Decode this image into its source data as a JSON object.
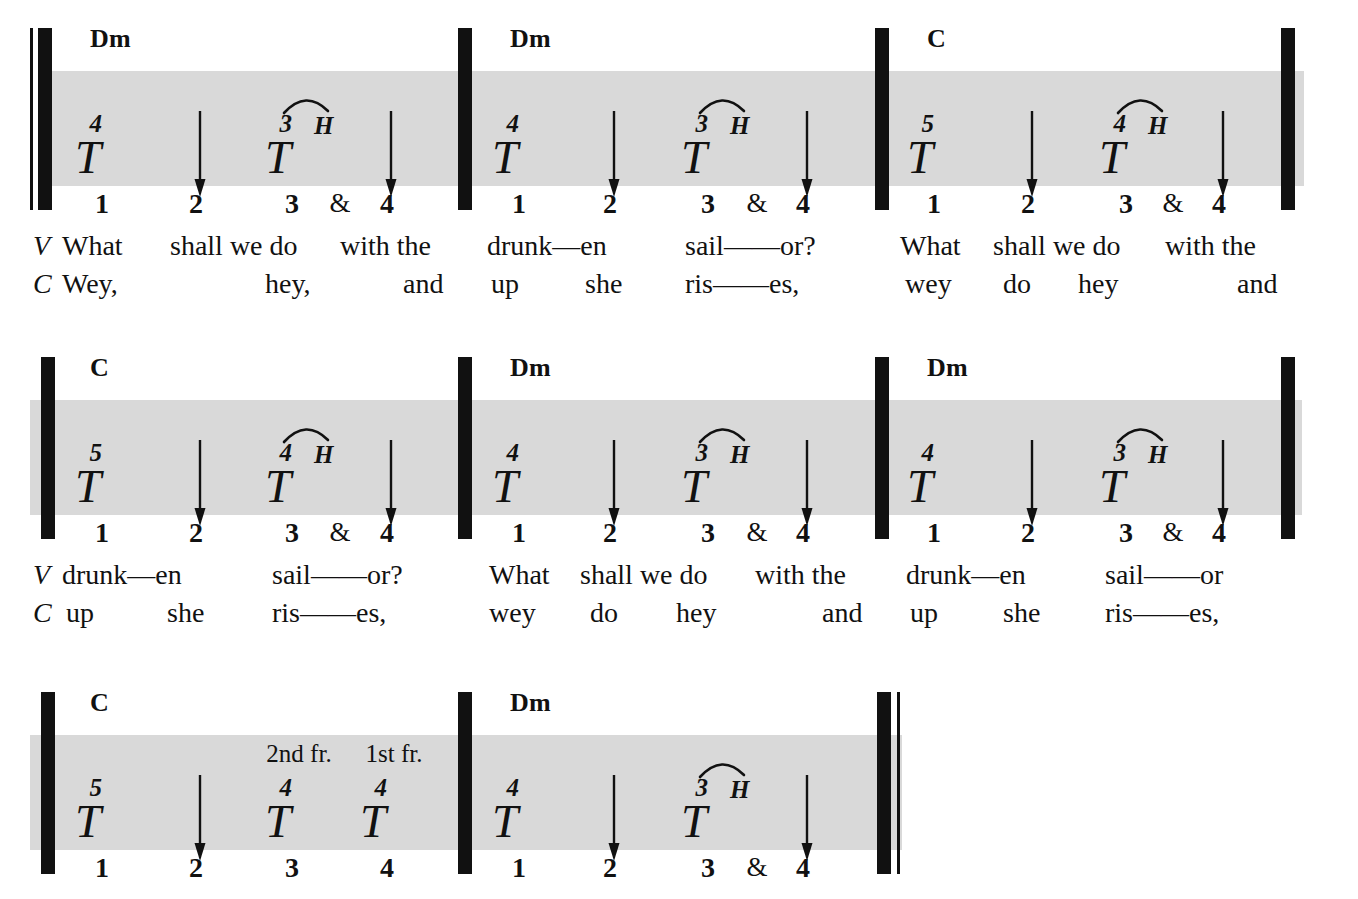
{
  "document": {
    "type": "guitar-tablature-rhythm-chart",
    "song_section": "What Shall We Do With The Drunken Sailor",
    "lyric_line_tags": {
      "verse": "V",
      "chorus": "C"
    },
    "colors": {
      "ink": "#111111",
      "band": "#d9d9d9",
      "page": "#ffffff"
    }
  },
  "systems": [
    {
      "id": "system-1",
      "measures": [
        {
          "id": "m1",
          "chord": "Dm",
          "slots": [
            {
              "beat": "1",
              "fret": "4",
              "symbol": "T",
              "hammer": null,
              "slur": false,
              "arrow": false,
              "fr_label": null
            },
            {
              "beat": "2",
              "fret": null,
              "symbol": null,
              "hammer": null,
              "slur": false,
              "arrow": true,
              "fr_label": null
            },
            {
              "beat": "3",
              "fret": "3",
              "symbol": "T",
              "hammer": "H",
              "slur": true,
              "arrow": false,
              "fr_label": null
            },
            {
              "beat": "&",
              "fret": null,
              "symbol": null,
              "hammer": null,
              "slur": false,
              "arrow": false,
              "fr_label": null
            },
            {
              "beat": "4",
              "fret": null,
              "symbol": null,
              "hammer": null,
              "slur": false,
              "arrow": true,
              "fr_label": null
            }
          ]
        },
        {
          "id": "m2",
          "chord": "Dm",
          "slots": [
            {
              "beat": "1",
              "fret": "4",
              "symbol": "T",
              "hammer": null,
              "slur": false,
              "arrow": false,
              "fr_label": null
            },
            {
              "beat": "2",
              "fret": null,
              "symbol": null,
              "hammer": null,
              "slur": false,
              "arrow": true,
              "fr_label": null
            },
            {
              "beat": "3",
              "fret": "3",
              "symbol": "T",
              "hammer": "H",
              "slur": true,
              "arrow": false,
              "fr_label": null
            },
            {
              "beat": "&",
              "fret": null,
              "symbol": null,
              "hammer": null,
              "slur": false,
              "arrow": false,
              "fr_label": null
            },
            {
              "beat": "4",
              "fret": null,
              "symbol": null,
              "hammer": null,
              "slur": false,
              "arrow": true,
              "fr_label": null
            }
          ]
        },
        {
          "id": "m3",
          "chord": "C",
          "slots": [
            {
              "beat": "1",
              "fret": "5",
              "symbol": "T",
              "hammer": null,
              "slur": false,
              "arrow": false,
              "fr_label": null
            },
            {
              "beat": "2",
              "fret": null,
              "symbol": null,
              "hammer": null,
              "slur": false,
              "arrow": true,
              "fr_label": null
            },
            {
              "beat": "3",
              "fret": "4",
              "symbol": "T",
              "hammer": "H",
              "slur": true,
              "arrow": false,
              "fr_label": null
            },
            {
              "beat": "&",
              "fret": null,
              "symbol": null,
              "hammer": null,
              "slur": false,
              "arrow": false,
              "fr_label": null
            },
            {
              "beat": "4",
              "fret": null,
              "symbol": null,
              "hammer": null,
              "slur": false,
              "arrow": true,
              "fr_label": null
            }
          ]
        }
      ],
      "lyrics": {
        "verse": [
          "What",
          "shall we do",
          "with the",
          "drunk—en",
          "sail——or?",
          "What",
          "shall we do",
          "with the"
        ],
        "chorus": [
          "Wey,",
          "hey,",
          "and",
          "up",
          "she",
          "ris——es,",
          "wey",
          "do",
          "hey",
          "and"
        ]
      }
    },
    {
      "id": "system-2",
      "measures": [
        {
          "id": "m4",
          "chord": "C",
          "slots": [
            {
              "beat": "1",
              "fret": "5",
              "symbol": "T",
              "hammer": null,
              "slur": false,
              "arrow": false,
              "fr_label": null
            },
            {
              "beat": "2",
              "fret": null,
              "symbol": null,
              "hammer": null,
              "slur": false,
              "arrow": true,
              "fr_label": null
            },
            {
              "beat": "3",
              "fret": "4",
              "symbol": "T",
              "hammer": "H",
              "slur": true,
              "arrow": false,
              "fr_label": null
            },
            {
              "beat": "&",
              "fret": null,
              "symbol": null,
              "hammer": null,
              "slur": false,
              "arrow": false,
              "fr_label": null
            },
            {
              "beat": "4",
              "fret": null,
              "symbol": null,
              "hammer": null,
              "slur": false,
              "arrow": true,
              "fr_label": null
            }
          ]
        },
        {
          "id": "m5",
          "chord": "Dm",
          "slots": [
            {
              "beat": "1",
              "fret": "4",
              "symbol": "T",
              "hammer": null,
              "slur": false,
              "arrow": false,
              "fr_label": null
            },
            {
              "beat": "2",
              "fret": null,
              "symbol": null,
              "hammer": null,
              "slur": false,
              "arrow": true,
              "fr_label": null
            },
            {
              "beat": "3",
              "fret": "3",
              "symbol": "T",
              "hammer": "H",
              "slur": true,
              "arrow": false,
              "fr_label": null
            },
            {
              "beat": "&",
              "fret": null,
              "symbol": null,
              "hammer": null,
              "slur": false,
              "arrow": false,
              "fr_label": null
            },
            {
              "beat": "4",
              "fret": null,
              "symbol": null,
              "hammer": null,
              "slur": false,
              "arrow": true,
              "fr_label": null
            }
          ]
        },
        {
          "id": "m6",
          "chord": "Dm",
          "slots": [
            {
              "beat": "1",
              "fret": "4",
              "symbol": "T",
              "hammer": null,
              "slur": false,
              "arrow": false,
              "fr_label": null
            },
            {
              "beat": "2",
              "fret": null,
              "symbol": null,
              "hammer": null,
              "slur": false,
              "arrow": true,
              "fr_label": null
            },
            {
              "beat": "3",
              "fret": "3",
              "symbol": "T",
              "hammer": "H",
              "slur": true,
              "arrow": false,
              "fr_label": null
            },
            {
              "beat": "&",
              "fret": null,
              "symbol": null,
              "hammer": null,
              "slur": false,
              "arrow": false,
              "fr_label": null
            },
            {
              "beat": "4",
              "fret": null,
              "symbol": null,
              "hammer": null,
              "slur": false,
              "arrow": true,
              "fr_label": null
            }
          ]
        }
      ],
      "lyrics": {
        "verse": [
          "drunk—en",
          "sail——or?",
          "What",
          "shall we do",
          "with the",
          "drunk—en",
          "sail——or"
        ],
        "chorus": [
          "up",
          "she",
          "ris——es,",
          "wey",
          "do",
          "hey",
          "and",
          "up",
          "she",
          "ris——es,"
        ]
      }
    },
    {
      "id": "system-3",
      "measures": [
        {
          "id": "m7",
          "chord": "C",
          "slots": [
            {
              "beat": "1",
              "fret": "5",
              "symbol": "T",
              "hammer": null,
              "slur": false,
              "arrow": false,
              "fr_label": null
            },
            {
              "beat": "2",
              "fret": null,
              "symbol": null,
              "hammer": null,
              "slur": false,
              "arrow": true,
              "fr_label": null
            },
            {
              "beat": "3",
              "fret": "4",
              "symbol": "T",
              "hammer": null,
              "slur": false,
              "arrow": false,
              "fr_label": "2nd fr."
            },
            {
              "beat": "4",
              "fret": "4",
              "symbol": "T",
              "hammer": null,
              "slur": false,
              "arrow": false,
              "fr_label": "1st fr."
            }
          ]
        },
        {
          "id": "m8",
          "chord": "Dm",
          "slots": [
            {
              "beat": "1",
              "fret": "4",
              "symbol": "T",
              "hammer": null,
              "slur": false,
              "arrow": false,
              "fr_label": null
            },
            {
              "beat": "2",
              "fret": null,
              "symbol": null,
              "hammer": null,
              "slur": false,
              "arrow": true,
              "fr_label": null
            },
            {
              "beat": "3",
              "fret": "3",
              "symbol": "T",
              "hammer": "H",
              "slur": true,
              "arrow": false,
              "fr_label": null
            },
            {
              "beat": "&",
              "fret": null,
              "symbol": null,
              "hammer": null,
              "slur": false,
              "arrow": false,
              "fr_label": null
            },
            {
              "beat": "4",
              "fret": null,
              "symbol": null,
              "hammer": null,
              "slur": false,
              "arrow": true,
              "fr_label": null
            }
          ]
        }
      ],
      "lyrics": {
        "verse": [],
        "chorus": []
      }
    }
  ],
  "layout": {
    "system_tops": [
      14,
      343,
      678
    ],
    "lyric_tops": [
      232,
      561
    ],
    "systems": [
      {
        "band": {
          "left": 52,
          "width": 1252
        },
        "barlines": [
          {
            "kind": "thin",
            "x": 30
          },
          {
            "kind": "thick",
            "x": 38
          },
          {
            "kind": "thick",
            "x": 458
          },
          {
            "kind": "thick",
            "x": 875
          },
          {
            "kind": "thick",
            "x": 1281
          }
        ],
        "measures": [
          {
            "left": 52,
            "chord_x": 38,
            "slot_x": [
              102,
              196,
              292,
              340,
              387
            ]
          },
          {
            "left": 472,
            "chord_x": 38,
            "slot_x": [
              519,
              610,
              708,
              757,
              803
            ]
          },
          {
            "left": 889,
            "chord_x": 38,
            "slot_x": [
              934,
              1028,
              1126,
              1173,
              1219
            ]
          }
        ]
      },
      {
        "band": {
          "left": 30,
          "width": 1272
        },
        "barlines": [
          {
            "kind": "thick",
            "x": 41
          },
          {
            "kind": "thick",
            "x": 458
          },
          {
            "kind": "thick",
            "x": 875
          },
          {
            "kind": "thick",
            "x": 1281
          }
        ],
        "measures": [
          {
            "left": 52,
            "chord_x": 38,
            "slot_x": [
              102,
              196,
              292,
              340,
              387
            ]
          },
          {
            "left": 472,
            "chord_x": 38,
            "slot_x": [
              519,
              610,
              708,
              757,
              803
            ]
          },
          {
            "left": 889,
            "chord_x": 38,
            "slot_x": [
              934,
              1028,
              1126,
              1173,
              1219
            ]
          }
        ]
      },
      {
        "band": {
          "left": 30,
          "width": 872
        },
        "barlines": [
          {
            "kind": "thick",
            "x": 41
          },
          {
            "kind": "thick",
            "x": 458
          },
          {
            "kind": "thick",
            "x": 877
          },
          {
            "kind": "thin",
            "x": 897
          }
        ],
        "measures": [
          {
            "left": 52,
            "chord_x": 38,
            "slot_x": [
              102,
              196,
              292,
              387
            ]
          },
          {
            "left": 472,
            "chord_x": 38,
            "slot_x": [
              519,
              610,
              708,
              757,
              803
            ]
          }
        ]
      }
    ],
    "lyric_lines": [
      {
        "tag_x": 33,
        "verse": [
          {
            "x": 62,
            "text": "What",
            "align": "left"
          },
          {
            "x": 170,
            "text": "shall we do",
            "align": "left"
          },
          {
            "x": 340,
            "text": "with the",
            "align": "left"
          },
          {
            "x": 487,
            "text": "drunk—en",
            "align": "left"
          },
          {
            "x": 685,
            "text": "sail——or?",
            "align": "left"
          },
          {
            "x": 900,
            "text": "What",
            "align": "left"
          },
          {
            "x": 993,
            "text": "shall we do",
            "align": "left"
          },
          {
            "x": 1165,
            "text": "with the",
            "align": "left"
          }
        ],
        "chorus": [
          {
            "x": 62,
            "text": "Wey,",
            "align": "left"
          },
          {
            "x": 265,
            "text": "hey,",
            "align": "left"
          },
          {
            "x": 403,
            "text": "and",
            "align": "left"
          },
          {
            "x": 491,
            "text": "up",
            "align": "left"
          },
          {
            "x": 585,
            "text": "she",
            "align": "left"
          },
          {
            "x": 685,
            "text": "ris——es,",
            "align": "left"
          },
          {
            "x": 905,
            "text": "wey",
            "align": "left"
          },
          {
            "x": 1003,
            "text": "do",
            "align": "left"
          },
          {
            "x": 1078,
            "text": "hey",
            "align": "left"
          },
          {
            "x": 1237,
            "text": "and",
            "align": "left"
          }
        ]
      },
      {
        "tag_x": 33,
        "verse": [
          {
            "x": 62,
            "text": "drunk—en",
            "align": "left"
          },
          {
            "x": 272,
            "text": "sail——or?",
            "align": "left"
          },
          {
            "x": 489,
            "text": "What",
            "align": "left"
          },
          {
            "x": 580,
            "text": "shall we do",
            "align": "left"
          },
          {
            "x": 755,
            "text": "with the",
            "align": "left"
          },
          {
            "x": 906,
            "text": "drunk—en",
            "align": "left"
          },
          {
            "x": 1105,
            "text": "sail——or",
            "align": "left"
          }
        ],
        "chorus": [
          {
            "x": 66,
            "text": "up",
            "align": "left"
          },
          {
            "x": 167,
            "text": "she",
            "align": "left"
          },
          {
            "x": 272,
            "text": "ris——es,",
            "align": "left"
          },
          {
            "x": 489,
            "text": "wey",
            "align": "left"
          },
          {
            "x": 590,
            "text": "do",
            "align": "left"
          },
          {
            "x": 676,
            "text": "hey",
            "align": "left"
          },
          {
            "x": 822,
            "text": "and",
            "align": "left"
          },
          {
            "x": 910,
            "text": "up",
            "align": "left"
          },
          {
            "x": 1003,
            "text": "she",
            "align": "left"
          },
          {
            "x": 1105,
            "text": "ris——es,",
            "align": "left"
          }
        ]
      }
    ]
  }
}
